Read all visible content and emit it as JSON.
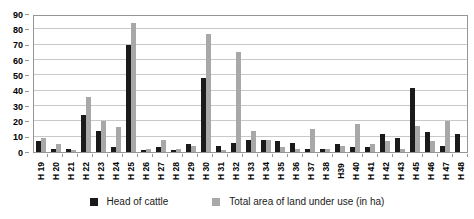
{
  "chart_data": {
    "type": "bar",
    "title": "",
    "xlabel": "",
    "ylabel": "",
    "ylim": [
      0,
      90
    ],
    "yticks": [
      0,
      10,
      20,
      30,
      40,
      50,
      60,
      70,
      80,
      90
    ],
    "grid": true,
    "legend_position": "bottom",
    "categories": [
      "H 19",
      "H 20",
      "H 21",
      "H 22",
      "H 23",
      "H 24",
      "H 25",
      "H 26",
      "H 27",
      "H 28",
      "H 29",
      "H 30",
      "H 31",
      "H 32",
      "H 33",
      "H 34",
      "H 35",
      "H 36",
      "H 37",
      "H 38",
      "H39",
      "H 40",
      "H 41",
      "H 42",
      "H 43",
      "H 45",
      "H 46",
      "H 47",
      "H 48"
    ],
    "series": [
      {
        "name": "Head of cattle",
        "color": "#1a1a1a",
        "values": [
          7,
          2,
          2,
          24,
          14,
          3,
          70,
          1,
          3,
          1,
          5,
          48,
          4,
          6,
          8,
          8,
          7,
          6,
          2,
          2,
          5,
          3,
          3,
          12,
          9,
          42,
          13,
          4,
          12
        ]
      },
      {
        "name": "Total area of land under use (in ha)",
        "color": "#a8a8a8",
        "values": [
          9,
          5,
          1,
          36,
          20,
          16,
          84,
          2,
          8,
          2,
          4,
          77,
          1,
          65,
          14,
          8,
          3,
          2,
          15,
          2,
          4,
          18,
          5,
          7,
          2,
          17,
          7,
          20,
          0
        ]
      }
    ]
  },
  "colors": {
    "series1": "#1a1a1a",
    "series2": "#a8a8a8",
    "gridline": "#c9c9c9",
    "axis_border": "#969696"
  }
}
